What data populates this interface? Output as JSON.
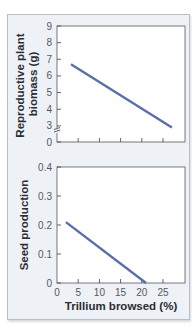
{
  "chart_data": [
    {
      "type": "line",
      "title": "",
      "xlabel": "",
      "ylabel": "Reproductive plant biomass (g)",
      "ylabel_lines": [
        "Reproductive plant",
        "biomass (g)"
      ],
      "xlim": [
        0,
        30
      ],
      "ylim": [
        2,
        9
      ],
      "axis_break": true,
      "y_ticks": [
        0,
        3,
        4,
        5,
        6,
        7,
        8,
        9
      ],
      "y_tick_labels": [
        "0",
        "3",
        "4",
        "5",
        "6",
        "7",
        "8",
        "9"
      ],
      "x_ticks": [
        5,
        10,
        15,
        20,
        25
      ],
      "x_tick_labels": [],
      "grid": false,
      "series": [
        {
          "name": "biomass",
          "color": "#5a6fa8",
          "x": [
            3.3,
            27.1
          ],
          "y": [
            6.7,
            2.9
          ]
        }
      ]
    },
    {
      "type": "line",
      "title": "",
      "xlabel": "Trillium browsed (%)",
      "ylabel": "Seed production",
      "xlim": [
        0,
        30
      ],
      "ylim": [
        0,
        0.4
      ],
      "y_ticks": [
        0,
        0.1,
        0.2,
        0.3,
        0.4
      ],
      "y_tick_labels": [
        "0",
        "0.1",
        "0.2",
        "0.3",
        "0.4"
      ],
      "x_ticks": [
        0,
        5,
        10,
        15,
        20,
        25
      ],
      "x_tick_labels": [
        "0",
        "5",
        "10",
        "15",
        "20",
        "25"
      ],
      "grid": false,
      "series": [
        {
          "name": "seed production",
          "color": "#5a6fa8",
          "x": [
            2.1,
            21.0
          ],
          "y": [
            0.21,
            0.0
          ]
        }
      ]
    }
  ],
  "colors": {
    "panel_bg": "#eef1f6",
    "panel_border": "#b9bec6",
    "plot_bg": "#ffffff",
    "axis": "#3a3d42",
    "line": "#5a6fa8"
  }
}
